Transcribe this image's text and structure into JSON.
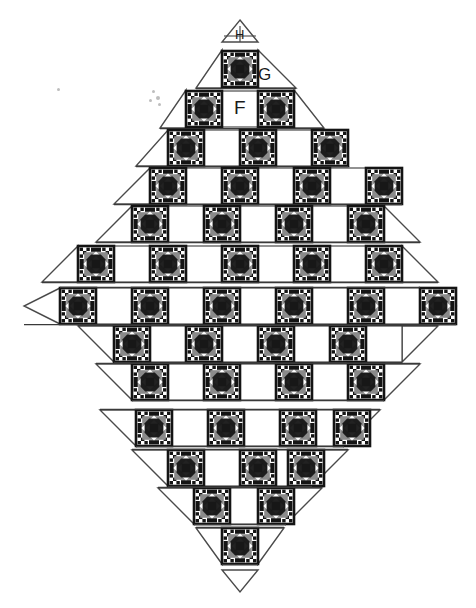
{
  "diagram": {
    "type": "quilt-layout",
    "shape": "diamond",
    "canvas": {
      "width": 476,
      "height": 608
    },
    "colors": {
      "background": "#ffffff",
      "outline": "#3a3a3a",
      "block_dark": "#141414",
      "block_gray": "#8a8a8a",
      "block_light": "#ffffff",
      "label_text": "#1a1a1a"
    },
    "labels": [
      {
        "id": "H",
        "text": "H",
        "target": "top-tip-triangle"
      },
      {
        "id": "G",
        "text": "G",
        "target": "row-1-setting-triangle"
      },
      {
        "id": "F",
        "text": "F",
        "target": "row-2-plain-square"
      }
    ],
    "block_legend": {
      "patterned_block_name": "pieced-star-block",
      "plain_block_name": "plain-white-square",
      "setting_triangle_name": "setting-triangle",
      "corner_triangle_name": "corner-triangle"
    },
    "geometry": {
      "block_size": 36,
      "row_height": 38,
      "first_row_top": 20,
      "center_x": 240
    },
    "rows": [
      {
        "index": 0,
        "kind": "tip-top",
        "patterned": 0,
        "plain": 0,
        "label": "H",
        "top": 20,
        "blocks": "plain triangle tip"
      },
      {
        "index": 1,
        "kind": "trapezoid-top",
        "patterned": 1,
        "plain": 0,
        "label": "G",
        "top": 50,
        "blocks": "P"
      },
      {
        "index": 2,
        "kind": "trapezoid-top",
        "patterned": 2,
        "plain": 1,
        "label": "F",
        "top": 90,
        "blocks": "P W P"
      },
      {
        "index": 3,
        "kind": "trapezoid-top",
        "patterned": 3,
        "plain": 2,
        "label": "",
        "top": 128,
        "blocks": "P W P W P"
      },
      {
        "index": 4,
        "kind": "trapezoid-top",
        "patterned": 4,
        "plain": 3,
        "label": "",
        "top": 166,
        "blocks": "P W P W P W P"
      },
      {
        "index": 5,
        "kind": "trapezoid-top",
        "patterned": 5,
        "plain": 4,
        "label": "",
        "top": 204,
        "blocks": "P W P W P W P W P"
      },
      {
        "index": 6,
        "kind": "trapezoid-top",
        "patterned": 6,
        "plain": 5,
        "label": "",
        "top": 242,
        "blocks": "P W P W P W P W P W P"
      },
      {
        "index": 7,
        "kind": "widest-band",
        "patterned": 7,
        "plain": 6,
        "label": "",
        "top": 288,
        "blocks": "P W P W P W P W P W P W P"
      },
      {
        "index": 8,
        "kind": "trapezoid-bot",
        "patterned": 6,
        "plain": 5,
        "label": "",
        "top": 326,
        "blocks": "P W P W P W P W P W P"
      },
      {
        "index": 9,
        "kind": "trapezoid-bot",
        "patterned": 5,
        "plain": 4,
        "label": "",
        "top": 364,
        "blocks": "P W P W P W P W P"
      },
      {
        "index": 10,
        "kind": "trapezoid-bot",
        "patterned": 4,
        "plain": 3,
        "label": "",
        "top": 412,
        "blocks": "P W P W P W P"
      },
      {
        "index": 11,
        "kind": "trapezoid-bot",
        "patterned": 3,
        "plain": 2,
        "label": "",
        "top": 450,
        "blocks": "P W P W P"
      },
      {
        "index": 12,
        "kind": "trapezoid-bot",
        "patterned": 2,
        "plain": 1,
        "label": "",
        "top": 488,
        "blocks": "P W P"
      },
      {
        "index": 13,
        "kind": "trapezoid-bot",
        "patterned": 1,
        "plain": 0,
        "label": "",
        "top": 530,
        "blocks": "P"
      },
      {
        "index": 14,
        "kind": "tip-bottom",
        "patterned": 0,
        "plain": 0,
        "label": "",
        "top": 570,
        "blocks": "plain triangle tip"
      }
    ],
    "totals": {
      "patterned_blocks": 49,
      "plain_blocks": 36,
      "rows": 15
    },
    "specks": [
      {
        "x": 57,
        "y": 88,
        "size": 3
      },
      {
        "x": 152,
        "y": 90,
        "size": 3
      },
      {
        "x": 156,
        "y": 96,
        "size": 4
      },
      {
        "x": 149,
        "y": 99,
        "size": 3
      },
      {
        "x": 158,
        "y": 103,
        "size": 3
      }
    ]
  }
}
